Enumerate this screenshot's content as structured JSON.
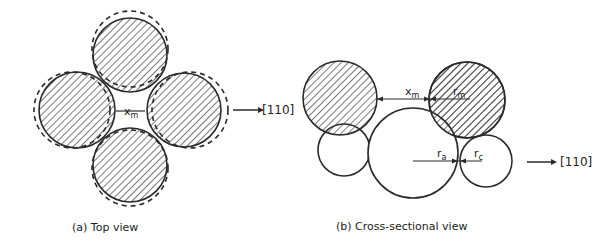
{
  "panel_a": {
    "caption": "(a) Top view",
    "gap_label": "x",
    "gap_sub": "m",
    "direction_label": "[110]"
  },
  "panel_b": {
    "caption": "(b) Cross-sectional view",
    "xm_label": "x",
    "xm_sub": "m",
    "rm_label": "r",
    "rm_sub": "m",
    "ra_label": "r",
    "ra_sub": "a",
    "rc_label": "r",
    "rc_sub": "c",
    "direction_label": "[110]"
  },
  "colors": {
    "stroke": "#2a2a2a",
    "background": "#ffffff"
  }
}
